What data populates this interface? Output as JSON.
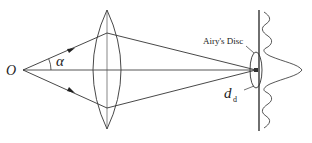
{
  "diagram": {
    "labels": {
      "object_point": "O",
      "half_angle": "α",
      "airy_disc": "Airy's Disc",
      "diameter_main": "d",
      "diameter_sub": "d"
    },
    "elements": [
      {
        "id": "object-point",
        "label": "O"
      },
      {
        "id": "lens",
        "type": "biconvex"
      },
      {
        "id": "optical-axis"
      },
      {
        "id": "marginal-rays",
        "count": 2
      },
      {
        "id": "image-screen"
      },
      {
        "id": "airy-disc"
      },
      {
        "id": "intensity-profile",
        "type": "airy-pattern"
      }
    ],
    "colors": {
      "line": "#333333",
      "background": "#ffffff"
    }
  }
}
